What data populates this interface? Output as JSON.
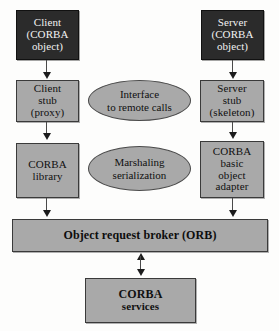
{
  "diagram": {
    "colors": {
      "dark_box_fill": "#2b2b2b",
      "dark_box_text": "#f2f2f2",
      "gray_fill": "#a9a9a9",
      "gray_text": "#101010",
      "border": "#3a3a3a",
      "arrow": "#1c1c1c",
      "background": "#fdfdfc"
    },
    "nodes": {
      "client_object": {
        "shape": "rectangle",
        "style": "dark",
        "lines": [
          "Client",
          "(CORBA",
          "object)"
        ]
      },
      "server_object": {
        "shape": "rectangle",
        "style": "dark",
        "lines": [
          "Server",
          "(CORBA",
          "object)"
        ]
      },
      "client_stub": {
        "shape": "rectangle",
        "style": "gray",
        "lines": [
          "Client",
          "stub",
          "(proxy)"
        ]
      },
      "server_stub": {
        "shape": "rectangle",
        "style": "gray",
        "lines": [
          "Server",
          "stub",
          "(skeleton)"
        ]
      },
      "corba_library": {
        "shape": "rectangle",
        "style": "gray",
        "lines": [
          "CORBA",
          "library"
        ]
      },
      "basic_object_adapter": {
        "shape": "rectangle",
        "style": "gray",
        "lines": [
          "CORBA",
          "basic",
          "object",
          "adapter"
        ]
      },
      "interface_ellipse": {
        "shape": "ellipse",
        "style": "gray",
        "lines": [
          "Interface",
          "to remote calls"
        ]
      },
      "marshaling_ellipse": {
        "shape": "ellipse",
        "style": "gray",
        "lines": [
          "Marshaling",
          "serialization"
        ]
      },
      "orb_bar": {
        "shape": "rectangle",
        "style": "gray",
        "lines": [
          "Object request broker (ORB)"
        ]
      },
      "corba_services": {
        "shape": "rectangle",
        "style": "gray",
        "lines": [
          "CORBA",
          "services"
        ]
      }
    },
    "connections": [
      {
        "name": "client-object-to-client-stub",
        "from": "client_object",
        "to": "client_stub",
        "direction": "down"
      },
      {
        "name": "client-stub-to-corba-library",
        "from": "client_stub",
        "to": "corba_library",
        "direction": "down"
      },
      {
        "name": "corba-library-to-orb",
        "from": "corba_library",
        "to": "orb_bar",
        "direction": "down"
      },
      {
        "name": "server-object-to-server-stub",
        "from": "server_object",
        "to": "server_stub",
        "direction": "down"
      },
      {
        "name": "server-stub-to-basic-object-adapter",
        "from": "server_stub",
        "to": "basic_object_adapter",
        "direction": "down"
      },
      {
        "name": "basic-object-adapter-to-orb",
        "from": "basic_object_adapter",
        "to": "orb_bar",
        "direction": "down"
      },
      {
        "name": "orb-to-corba-services",
        "from": "orb_bar",
        "to": "corba_services",
        "direction": "bidirectional"
      }
    ]
  }
}
